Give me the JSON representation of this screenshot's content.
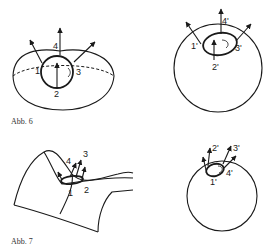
{
  "figures": [
    {
      "caption": "Abb. 6",
      "left": {
        "name": "hemisphere",
        "labels": [
          "1",
          "2",
          "3",
          "4"
        ]
      },
      "right": {
        "name": "sphere-image",
        "labels": [
          "1'",
          "2'",
          "3'",
          "4'"
        ]
      }
    },
    {
      "caption": "Abb. 7",
      "left": {
        "name": "saddle-surface",
        "labels": [
          "1",
          "2",
          "3",
          "4"
        ]
      },
      "right": {
        "name": "sphere-image",
        "labels": [
          "1'",
          "2'",
          "3'",
          "4'"
        ]
      }
    }
  ],
  "colors": {
    "ink": "#1a1a1a",
    "background": "#ffffff"
  }
}
